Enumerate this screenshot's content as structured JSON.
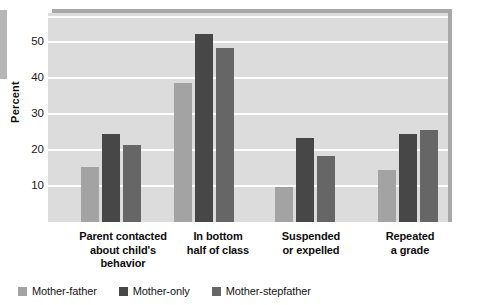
{
  "chart_data": {
    "type": "bar",
    "title": "",
    "subtitle": "",
    "xlabel": "",
    "ylabel": "Percent",
    "ylim": [
      0,
      58
    ],
    "yticks": [
      10,
      20,
      30,
      40,
      50
    ],
    "ytick_labels": [
      "10",
      "20",
      "30",
      "40",
      "50"
    ],
    "grid": true,
    "legend_position": "bottom-left",
    "categories": [
      "Parent contacted about child's behavior",
      "In bottom half of class",
      "Suspended or expelled",
      "Repeated a grade"
    ],
    "category_label_lines": [
      [
        "Parent contacted",
        "about child's",
        "behavior"
      ],
      [
        "In bottom",
        "half of class"
      ],
      [
        "Suspended",
        "or expelled"
      ],
      [
        "Repeated",
        "a grade"
      ]
    ],
    "series": [
      {
        "name": "Mother-father",
        "color": "#a3a3a3",
        "values": [
          15.3,
          38.5,
          9.6,
          14.5
        ]
      },
      {
        "name": "Mother-only",
        "color": "#474747",
        "values": [
          24.4,
          52.3,
          23.3,
          24.3
        ]
      },
      {
        "name": "Mother-stepfather",
        "color": "#666666",
        "values": [
          21.3,
          48.3,
          18.4,
          25.4
        ]
      }
    ]
  },
  "legend": {
    "items": [
      {
        "label": "Mother-father",
        "color": "#a3a3a3"
      },
      {
        "label": "Mother-only",
        "color": "#474747"
      },
      {
        "label": "Mother-stepfather",
        "color": "#666666"
      }
    ]
  },
  "axis": {
    "y_title": "Percent"
  },
  "colors": {
    "plot_background": "#dcdcdc",
    "gridline": "#fdfdfd",
    "frame_shadow": "#a8a8a8",
    "page_background": "#ffffff",
    "text": "#0d0d0d"
  }
}
